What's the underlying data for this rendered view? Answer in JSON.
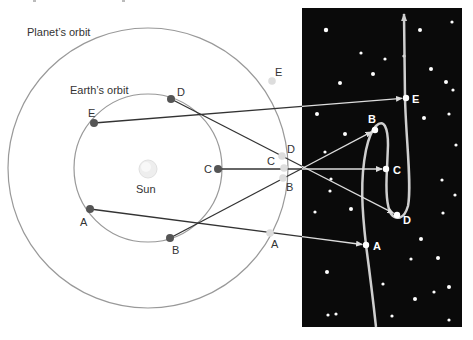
{
  "labels": {
    "planet_orbit": "Planet’s orbit",
    "earth_orbit": "Earth’s orbit",
    "sun": "Sun"
  },
  "colors": {
    "background": "#ffffff",
    "orbit": "#999999",
    "earth_dot": "#555555",
    "planet_dot": "#dddddd",
    "sight_line": "#333333",
    "sky": "#0a0a0a",
    "path": "#cfcfcf",
    "star": "#ffffff",
    "sun": "#eeeeee"
  },
  "geometry": {
    "center": [
      148,
      168
    ],
    "planet_orbit_r": 140,
    "earth_orbit_r": 74,
    "sky_panel": [
      302,
      8,
      160,
      319
    ]
  },
  "earth_positions": [
    {
      "id": "A",
      "x": 90,
      "y": 209,
      "lx": 80,
      "ly": 226
    },
    {
      "id": "B",
      "x": 170,
      "y": 238,
      "lx": 172,
      "ly": 254
    },
    {
      "id": "C",
      "x": 218,
      "y": 169,
      "lx": 204,
      "ly": 173
    },
    {
      "id": "D",
      "x": 171,
      "y": 99,
      "lx": 177,
      "ly": 96
    },
    {
      "id": "E",
      "x": 94,
      "y": 123,
      "lx": 88,
      "ly": 117
    }
  ],
  "planet_positions": [
    {
      "id": "A",
      "x": 270,
      "y": 233,
      "lx": 271,
      "ly": 248
    },
    {
      "id": "B",
      "x": 283,
      "y": 178,
      "lx": 286,
      "ly": 191
    },
    {
      "id": "C",
      "x": 284,
      "y": 168,
      "lx": 267,
      "ly": 165
    },
    {
      "id": "D",
      "x": 282,
      "y": 156,
      "lx": 287,
      "ly": 153
    },
    {
      "id": "E",
      "x": 272,
      "y": 81,
      "lx": 275,
      "ly": 76
    }
  ],
  "sky_positions": [
    {
      "id": "A",
      "x": 366,
      "y": 245,
      "lx": 373,
      "ly": 250
    },
    {
      "id": "B",
      "x": 375,
      "y": 130,
      "lx": 368,
      "ly": 123
    },
    {
      "id": "C",
      "x": 386,
      "y": 169,
      "lx": 393,
      "ly": 174
    },
    {
      "id": "D",
      "x": 397,
      "y": 215,
      "lx": 403,
      "ly": 224
    },
    {
      "id": "E",
      "x": 406,
      "y": 98,
      "lx": 412,
      "ly": 103
    }
  ],
  "stars": [
    [
      326,
      30,
      2.2
    ],
    [
      420,
      30,
      2
    ],
    [
      452,
      22,
      1.6
    ],
    [
      361,
      53,
      1.6
    ],
    [
      385,
      59,
      1.6
    ],
    [
      431,
      69,
      2
    ],
    [
      340,
      83,
      2
    ],
    [
      373,
      74,
      2
    ],
    [
      446,
      82,
      2
    ],
    [
      453,
      90,
      1.6
    ],
    [
      317,
      114,
      2
    ],
    [
      424,
      118,
      2
    ],
    [
      449,
      114,
      1.6
    ],
    [
      345,
      134,
      2
    ],
    [
      325,
      152,
      1.6
    ],
    [
      456,
      145,
      1.6
    ],
    [
      331,
      179,
      1.6
    ],
    [
      330,
      191,
      1.6
    ],
    [
      315,
      212,
      1.6
    ],
    [
      351,
      209,
      2
    ],
    [
      442,
      180,
      1.6
    ],
    [
      455,
      195,
      1.6
    ],
    [
      443,
      213,
      1.6
    ],
    [
      421,
      239,
      2
    ],
    [
      411,
      259,
      1.6
    ],
    [
      438,
      258,
      2
    ],
    [
      327,
      272,
      2
    ],
    [
      383,
      284,
      1.6
    ],
    [
      449,
      287,
      2
    ],
    [
      415,
      299,
      2
    ],
    [
      434,
      292,
      1.6
    ],
    [
      328,
      315,
      1.6
    ],
    [
      336,
      314,
      1.6
    ],
    [
      392,
      316,
      1.6
    ],
    [
      449,
      320,
      1.6
    ],
    [
      404,
      56,
      1.6
    ]
  ]
}
